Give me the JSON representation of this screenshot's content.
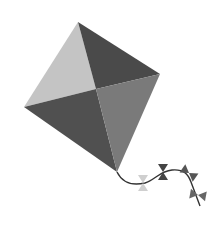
{
  "image": {
    "subject": "kite",
    "description": "Grayscale illustration of a diamond-shaped kite with four shaded quadrants and a curly tail with four bow ties",
    "width": 221,
    "height": 231,
    "background": "#ffffff"
  },
  "kite": {
    "vertices": {
      "top": [
        78,
        22
      ],
      "right": [
        160,
        74
      ],
      "bottom": [
        117,
        172
      ],
      "left": [
        24,
        107
      ],
      "center": [
        96,
        89
      ]
    },
    "colors": {
      "top_left": "#c4c4c4",
      "top_right": "#4a4a4a",
      "bottom_left": "#505050",
      "bottom_right": "#7a7a7a"
    }
  },
  "tail": {
    "color": "#333333",
    "bows": [
      {
        "x": 143,
        "y": 183,
        "angle": 90,
        "color": "#cfcfcf"
      },
      {
        "x": 163,
        "y": 172,
        "angle": 90,
        "color": "#444444"
      },
      {
        "x": 189,
        "y": 173,
        "angle": 35,
        "color": "#555555"
      },
      {
        "x": 198,
        "y": 195,
        "angle": 10,
        "color": "#666666"
      }
    ]
  }
}
